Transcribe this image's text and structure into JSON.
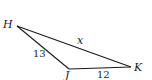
{
  "diagram": {
    "type": "triangle",
    "vertices": [
      {
        "name": "H",
        "x": 17,
        "y": 26
      },
      {
        "name": "J",
        "x": 69,
        "y": 69
      },
      {
        "name": "K",
        "x": 131,
        "y": 67
      }
    ],
    "sides": [
      {
        "from": "H",
        "to": "K",
        "label": "x"
      },
      {
        "from": "H",
        "to": "J",
        "label": "13"
      },
      {
        "from": "J",
        "to": "K",
        "label": "12"
      }
    ],
    "labels": {
      "H": "H",
      "J": "J",
      "K": "K",
      "HK": "x",
      "HJ": "13",
      "JK": "12"
    },
    "stroke_color": "#1a1a1a"
  }
}
